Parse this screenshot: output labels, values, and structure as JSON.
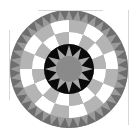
{
  "figure": {
    "center": [
      69,
      69
    ],
    "outer_radius": 59,
    "rings": {
      "sawtooth": {
        "r_outer": 59,
        "r_inner": 49,
        "count": 40,
        "base": "#9a9a9a",
        "tooth": "#6e6e6e"
      },
      "checker_outer": {
        "r_outer": 49,
        "r_inner": 37,
        "count": 16,
        "colors": [
          "#b4b4b4",
          "#ffffff"
        ]
      },
      "checker_inner": {
        "r_outer": 37,
        "r_inner": 25,
        "count": 16,
        "colors": [
          "#ffffff",
          "#b4b4b4"
        ]
      },
      "black_disk": {
        "r": 25,
        "color": "#0a0a0a"
      },
      "star": {
        "points": 12,
        "r_outer": 24,
        "r_inner": 13,
        "color": "#a8a8a8"
      },
      "center_disk": {
        "r": 13,
        "color": "#8a8a8a"
      }
    }
  }
}
